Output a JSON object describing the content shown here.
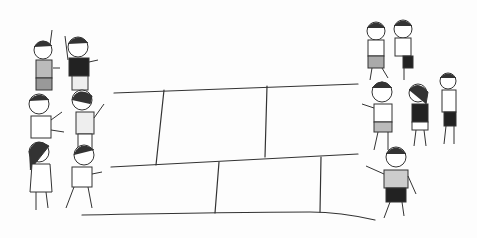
{
  "scene": {
    "description": "Line drawing of children playing a line game (like Red Rover / crossing game) with a court drawn on the ground",
    "style": "pencil sketch with light grey tones",
    "colors": {
      "background": "#fdfdfd",
      "line": "#333333",
      "shade": "#bdbdbd",
      "dark": "#222222"
    },
    "left_group": {
      "count": 6,
      "label": "children-left-team"
    },
    "right_group": {
      "count": 6,
      "label": "children-right-team"
    },
    "court": {
      "rows": 2,
      "top_row_cells": 3,
      "bottom_row_cells": 3
    }
  }
}
